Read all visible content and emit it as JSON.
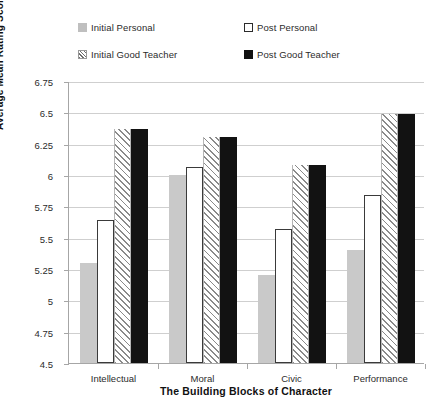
{
  "chart_data": {
    "type": "bar",
    "title": "",
    "xlabel": "The Building Blocks of Character",
    "ylabel": "Average Mean Rating Score",
    "categories": [
      "Intellectual",
      "Moral",
      "Civic",
      "Performance"
    ],
    "series": [
      {
        "name": "Initial Personal",
        "marker": "solid-light-gray-square",
        "color": "#c9c9c9",
        "values": [
          5.3,
          6.0,
          5.2,
          5.4
        ]
      },
      {
        "name": "Post Personal",
        "marker": "open-black-outlined-square",
        "color": "#ffffff",
        "values": [
          5.64,
          6.06,
          5.57,
          5.84
        ]
      },
      {
        "name": "Initial Good Teacher",
        "marker": "diagonal-hatched-square",
        "color": "#8a8a8a",
        "values": [
          6.37,
          6.3,
          6.08,
          6.49
        ]
      },
      {
        "name": "Post Good Teacher",
        "marker": "solid-black-square",
        "color": "#121212",
        "values": [
          6.37,
          6.3,
          6.08,
          6.49
        ]
      }
    ],
    "ylim": [
      4.5,
      6.75
    ],
    "ytick_labels": [
      "6.75",
      "6.5",
      "6.25",
      "6",
      "5.75",
      "5.5",
      "5.25",
      "5",
      "4.75",
      "4.5"
    ],
    "ytick_values": [
      6.75,
      6.5,
      6.25,
      6,
      5.75,
      5.5,
      5.25,
      5,
      4.75,
      4.5
    ],
    "grid": true,
    "legend_position": "top",
    "legend_columns": 2
  }
}
